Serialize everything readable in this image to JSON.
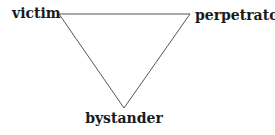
{
  "diagram": {
    "type": "triangle",
    "vertices": {
      "top_left": "victim",
      "top_right": "perpetrator",
      "bottom": "bystander"
    },
    "labels": {
      "victim": "victim",
      "perpetrator": "perpetrator",
      "bystander": "bystander"
    },
    "line_color": "#555555",
    "text_color": "#1a1a1a"
  }
}
